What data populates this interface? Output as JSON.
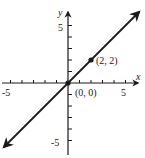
{
  "chart_data": {
    "type": "line",
    "title": "",
    "xlabel": "x",
    "ylabel": "y",
    "xlim": [
      -5.5,
      6
    ],
    "ylim": [
      -6,
      6
    ],
    "grid": false,
    "x_tick_labels": [
      "-5",
      "5"
    ],
    "y_tick_labels": [
      "5",
      "-5"
    ],
    "tick_step": 1,
    "series": [
      {
        "name": "y = x",
        "equation": "y = x",
        "x": [
          -5.5,
          6
        ],
        "y": [
          -5.5,
          6
        ],
        "arrows": "both"
      }
    ],
    "points": [
      {
        "x": 0,
        "y": 0,
        "label": "(0, 0)"
      },
      {
        "x": 2,
        "y": 2,
        "label": "(2, 2)"
      }
    ]
  },
  "labels": {
    "x_axis": "x",
    "y_axis": "y",
    "x_neg": "-5",
    "x_pos": "5",
    "y_pos": "5",
    "y_neg": "-5",
    "origin": "(0, 0)",
    "point": "(2, 2)"
  }
}
